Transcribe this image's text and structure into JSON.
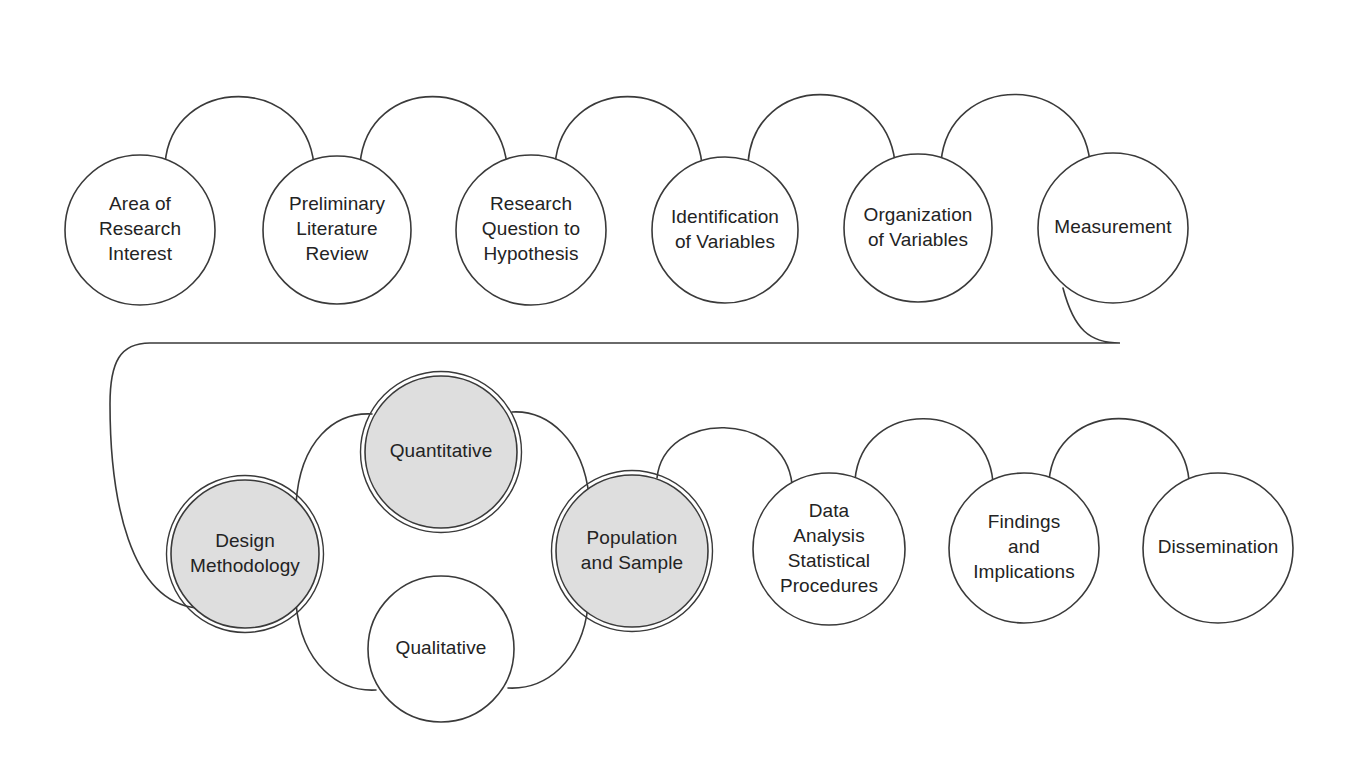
{
  "diagram": {
    "type": "flow-chain",
    "canvas": {
      "width": 1356,
      "height": 757
    },
    "style": {
      "background": "#ffffff",
      "stroke": "#3a3a3a",
      "text": "#232323",
      "shaded_fill": "#dedede",
      "plain_fill": "#ffffff"
    },
    "rows": [
      {
        "name": "row-one",
        "nodes": [
          {
            "id": "area-of-research-interest",
            "lines": [
              "Area of",
              "Research",
              "Interest"
            ],
            "cx": 140,
            "cy": 230,
            "r": 75,
            "shaded": false,
            "double_ring": false
          },
          {
            "id": "preliminary-literature-review",
            "lines": [
              "Preliminary",
              "Literature",
              "Review"
            ],
            "cx": 337,
            "cy": 230,
            "r": 74,
            "shaded": false,
            "double_ring": false
          },
          {
            "id": "research-question-to-hypothesis",
            "lines": [
              "Research",
              "Question to",
              "Hypothesis"
            ],
            "cx": 531,
            "cy": 230,
            "r": 75,
            "shaded": false,
            "double_ring": false
          },
          {
            "id": "identification-of-variables",
            "lines": [
              "Identification",
              "of Variables"
            ],
            "cx": 725,
            "cy": 230,
            "r": 73,
            "shaded": false,
            "double_ring": false
          },
          {
            "id": "organization-of-variables",
            "lines": [
              "Organization",
              "of Variables"
            ],
            "cx": 918,
            "cy": 228,
            "r": 74,
            "shaded": false,
            "double_ring": false
          },
          {
            "id": "measurement",
            "lines": [
              "Measurement"
            ],
            "cx": 1113,
            "cy": 228,
            "r": 75,
            "shaded": false,
            "double_ring": false
          }
        ]
      },
      {
        "name": "row-two",
        "nodes": [
          {
            "id": "design-methodology",
            "lines": [
              "Design",
              "Methodology"
            ],
            "cx": 245,
            "cy": 554,
            "r": 74,
            "shaded": true,
            "double_ring": true
          },
          {
            "id": "quantitative",
            "lines": [
              "Quantitative"
            ],
            "cx": 441,
            "cy": 452,
            "r": 76,
            "shaded": true,
            "double_ring": true
          },
          {
            "id": "qualitative",
            "lines": [
              "Qualitative"
            ],
            "cx": 441,
            "cy": 649,
            "r": 73,
            "shaded": false,
            "double_ring": false
          },
          {
            "id": "population-and-sample",
            "lines": [
              "Population",
              "and Sample"
            ],
            "cx": 632,
            "cy": 551,
            "r": 76,
            "shaded": true,
            "double_ring": true
          },
          {
            "id": "data-analysis-statistical-procedures",
            "lines": [
              "Data",
              "Analysis",
              "Statistical",
              "Procedures"
            ],
            "cx": 829,
            "cy": 549,
            "r": 76,
            "shaded": false,
            "double_ring": false
          },
          {
            "id": "findings-and-implications",
            "lines": [
              "Findings",
              "and",
              "Implications"
            ],
            "cx": 1024,
            "cy": 548,
            "r": 75,
            "shaded": false,
            "double_ring": false
          },
          {
            "id": "dissemination",
            "lines": [
              "Dissemination"
            ],
            "cx": 1218,
            "cy": 548,
            "r": 75,
            "shaded": false,
            "double_ring": false
          }
        ]
      }
    ],
    "connectors": [
      {
        "id": "link-area-to-preliminary",
        "from": "area-of-research-interest",
        "to": "preliminary-literature-review",
        "path": "M 165 164 C 172 74 305 74 314 165"
      },
      {
        "id": "link-preliminary-to-question",
        "from": "preliminary-literature-review",
        "to": "research-question-to-hypothesis",
        "path": "M 360 164 C 368 74 497 74 507 165"
      },
      {
        "id": "link-question-to-identification",
        "from": "research-question-to-hypothesis",
        "to": "identification-of-variables",
        "path": "M 555 165 C 562 74 692 74 702 164"
      },
      {
        "id": "link-identification-to-organization",
        "from": "identification-of-variables",
        "to": "organization-of-variables",
        "path": "M 748 163 C 755 72 884 72 895 162"
      },
      {
        "id": "link-organization-to-measurement",
        "from": "organization-of-variables",
        "to": "measurement",
        "path": "M 941 162 C 949 72 1080 72 1090 162"
      },
      {
        "id": "link-measurement-to-design",
        "from": "measurement",
        "to": "design-methodology",
        "path": "M 1063 288 C 1074 330 1090 343 1120 343 L 150 343 C 120 343 110 362 110 404 C 110 500 130 600 196 608"
      },
      {
        "id": "link-design-to-quantitative",
        "from": "design-methodology",
        "to": "quantitative",
        "path": "M 296 504 C 300 440 335 412 372 414"
      },
      {
        "id": "link-design-to-qualitative",
        "from": "design-methodology",
        "to": "qualitative",
        "path": "M 296 604 C 302 664 338 692 376 690"
      },
      {
        "id": "link-quantitative-to-population",
        "from": "quantitative",
        "to": "population-and-sample",
        "path": "M 512 412 C 548 410 583 440 589 496"
      },
      {
        "id": "link-qualitative-to-population",
        "from": "qualitative",
        "to": "population-and-sample",
        "path": "M 508 688 C 545 690 582 662 588 606"
      },
      {
        "id": "link-population-to-data",
        "from": "population-and-sample",
        "to": "data-analysis-statistical-procedures",
        "path": "M 657 478 C 664 410 784 410 792 484"
      },
      {
        "id": "link-data-to-findings",
        "from": "data-analysis-statistical-procedures",
        "to": "findings-and-implications",
        "path": "M 855 480 C 862 398 985 398 993 482"
      },
      {
        "id": "link-findings-to-dissemination",
        "from": "findings-and-implications",
        "to": "dissemination",
        "path": "M 1049 481 C 1056 398 1181 398 1189 480"
      }
    ]
  }
}
